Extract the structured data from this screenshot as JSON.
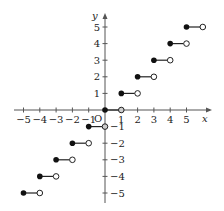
{
  "chart_data": {
    "type": "line",
    "title": "",
    "subtitle": "Floor (greatest integer) step function y = [x]",
    "xlabel": "x",
    "ylabel": "y",
    "origin_label": "O",
    "xlim": [
      -5.5,
      6.5
    ],
    "ylim": [
      -5.6,
      6.0
    ],
    "x_ticks": [
      -5,
      -4,
      -3,
      -2,
      -1,
      1,
      2,
      3,
      4,
      5
    ],
    "x_tick_labels": [
      "−5",
      "−4",
      "−3",
      "−2",
      "−1",
      "1",
      "2",
      "3",
      "4",
      "5"
    ],
    "y_ticks": [
      -5,
      -4,
      -3,
      -2,
      -1,
      1,
      2,
      3,
      4,
      5
    ],
    "y_tick_labels": [
      "−5",
      "−4",
      "−3",
      "−2",
      "−1",
      "1",
      "2",
      "3",
      "4",
      "5"
    ],
    "grid": false,
    "legend": null,
    "series": [
      {
        "name": "steps",
        "segments": [
          {
            "x_start": -5,
            "x_end": -4,
            "y": -5,
            "start": "closed",
            "end": "open"
          },
          {
            "x_start": -4,
            "x_end": -3,
            "y": -4,
            "start": "closed",
            "end": "open"
          },
          {
            "x_start": -3,
            "x_end": -2,
            "y": -3,
            "start": "closed",
            "end": "open"
          },
          {
            "x_start": -2,
            "x_end": -1,
            "y": -2,
            "start": "closed",
            "end": "open"
          },
          {
            "x_start": -1,
            "x_end": 0,
            "y": -1,
            "start": "closed",
            "end": "open"
          },
          {
            "x_start": 0,
            "x_end": 1,
            "y": 0,
            "start": "closed",
            "end": "open"
          },
          {
            "x_start": 1,
            "x_end": 2,
            "y": 1,
            "start": "closed",
            "end": "open"
          },
          {
            "x_start": 2,
            "x_end": 3,
            "y": 2,
            "start": "closed",
            "end": "open"
          },
          {
            "x_start": 3,
            "x_end": 4,
            "y": 3,
            "start": "closed",
            "end": "open"
          },
          {
            "x_start": 4,
            "x_end": 5,
            "y": 4,
            "start": "closed",
            "end": "open"
          },
          {
            "x_start": 5,
            "x_end": 6,
            "y": 5,
            "start": "closed",
            "end": "open"
          }
        ]
      }
    ]
  },
  "layout": {
    "origin_px": [
      105,
      110
    ],
    "unit_x_px": 16.3,
    "unit_y_px": 16.6,
    "x_axis_px": [
      14,
      212
    ],
    "y_axis_px": [
      203,
      13
    ]
  },
  "colors": {
    "axis": "#555555",
    "line": "#222222",
    "closed_dot": "#111111",
    "open_dot_fill": "#ffffff",
    "open_dot_on_axis_fill": "#cccccc"
  }
}
